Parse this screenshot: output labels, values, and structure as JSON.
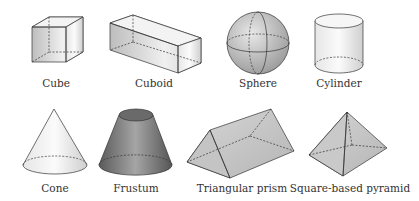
{
  "diagram": {
    "shapes": [
      {
        "id": "cube",
        "label": "Cube"
      },
      {
        "id": "cuboid",
        "label": "Cuboid"
      },
      {
        "id": "sphere",
        "label": "Sphere"
      },
      {
        "id": "cylinder",
        "label": "Cylinder"
      },
      {
        "id": "cone",
        "label": "Cone"
      },
      {
        "id": "frustum",
        "label": "Frustum"
      },
      {
        "id": "triangular-prism",
        "label": "Triangular prism"
      },
      {
        "id": "square-based-pyramid",
        "label": "Square-based pyramid"
      }
    ],
    "colors": {
      "stroke": "#333333",
      "light": "#f2f2f2",
      "mid": "#c8c8c8",
      "dark": "#555555"
    }
  }
}
